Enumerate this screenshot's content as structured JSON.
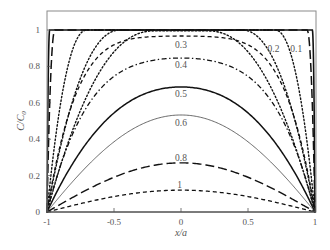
{
  "chart_data": {
    "type": "line",
    "title": "",
    "xlabel": "x/a",
    "ylabel": "C/C0",
    "xlim": [
      -1,
      1
    ],
    "ylim": [
      0,
      1.03
    ],
    "x_ticks": [
      -1,
      -0.5,
      0,
      0.5,
      1
    ],
    "x_tick_labels": [
      "-1",
      "-0.5",
      "0",
      "0.5",
      "1"
    ],
    "y_ticks": [
      0,
      0.2,
      0.4,
      0.6,
      0.8,
      1
    ],
    "y_tick_labels": [
      "0",
      "0.2",
      "0.4",
      "0.6",
      "0.8",
      "1"
    ],
    "grid": false,
    "legend": "none (inline curve labels)",
    "series": [
      {
        "name": "0.005",
        "label": "",
        "center_value": 1.0,
        "edge_width": 0.02,
        "style": "solid",
        "width": 1.6
      },
      {
        "name": "0.01",
        "label": "",
        "center_value": 1.0,
        "edge_width": 0.06,
        "style": "longdash",
        "width": 1.5
      },
      {
        "name": "0.05",
        "label": "",
        "center_value": 1.0,
        "edge_width": 0.3,
        "style": "dotted",
        "width": 1.4
      },
      {
        "name": "0.1",
        "label": "0.1",
        "center_value": 1.0,
        "edge_width": 0.55,
        "style": "dotted",
        "width": 1.4
      },
      {
        "name": "0.2",
        "label": "0.2",
        "center_value": 0.995,
        "edge_width": 0.8,
        "style": "dotted",
        "width": 1.4
      },
      {
        "name": "0.3",
        "label": "0.3",
        "center_value": 0.967,
        "edge_width": 1.0,
        "style": "dashed",
        "width": 1.3
      },
      {
        "name": "0.4",
        "label": "0.4",
        "center_value": 0.846,
        "edge_width": 1.0,
        "style": "dashdot",
        "width": 1.3
      },
      {
        "name": "0.5",
        "label": "0.5",
        "center_value": 0.687,
        "edge_width": 1.0,
        "style": "solid",
        "width": 1.5
      },
      {
        "name": "0.6",
        "label": "0.6",
        "center_value": 0.533,
        "edge_width": 1.0,
        "style": "thin",
        "width": 0.8
      },
      {
        "name": "0.8",
        "label": "0.8",
        "center_value": 0.27,
        "edge_width": 1.0,
        "style": "longdash",
        "width": 1.4
      },
      {
        "name": "1",
        "label": "1",
        "center_value": 0.12,
        "edge_width": 1.0,
        "style": "dashed",
        "width": 1.3
      }
    ],
    "labels_positions": [
      {
        "text": "0.3",
        "x": 0.0,
        "y": 0.9
      },
      {
        "text": "0.4",
        "x": 0.0,
        "y": 0.79
      },
      {
        "text": "0.5",
        "x": 0.0,
        "y": 0.63
      },
      {
        "text": "0.6",
        "x": 0.0,
        "y": 0.47
      },
      {
        "text": "0.8",
        "x": 0.0,
        "y": 0.28
      },
      {
        "text": "1",
        "x": -0.01,
        "y": 0.13
      },
      {
        "text": "0.2",
        "x": 0.69,
        "y": 0.88
      },
      {
        "text": "0.1",
        "x": 0.86,
        "y": 0.88
      }
    ]
  },
  "axes": {
    "xlabel_text": "x/a",
    "ylabel_main": "C/C",
    "ylabel_sub": "0"
  }
}
